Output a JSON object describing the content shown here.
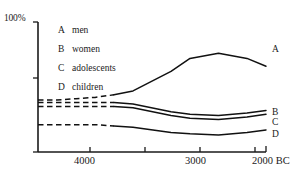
{
  "chart_data": {
    "type": "line",
    "title": "",
    "xlabel": "",
    "ylabel": "",
    "y_axis_top_label": "100%",
    "x_tick_labels": [
      "4000",
      "3000",
      "2000 BC"
    ],
    "x_tick_values": [
      4000,
      3000,
      2000
    ],
    "xlim": [
      4400,
      2000
    ],
    "ylim": [
      0,
      100
    ],
    "grid": false,
    "legend_position": "inside-upper-left",
    "x_axis_direction": "decreasing",
    "note": "Values are percentages of population; left portion of each curve is dashed (estimated/extrapolated), right portion solid (attested).",
    "series": [
      {
        "key": "A",
        "name": "men",
        "end_label": "A",
        "style": "dashed-then-solid",
        "dash_until_x": 3600,
        "x": [
          4400,
          4200,
          4000,
          3800,
          3600,
          3400,
          3000,
          2800,
          2500,
          2200,
          2000
        ],
        "values": [
          40,
          40,
          41,
          42,
          44,
          47,
          62,
          72,
          76,
          72,
          66
        ]
      },
      {
        "key": "B",
        "name": "women",
        "end_label": "B",
        "style": "dashed-then-solid",
        "dash_until_x": 3600,
        "x": [
          4400,
          4200,
          4000,
          3800,
          3600,
          3400,
          3000,
          2800,
          2500,
          2200,
          2000
        ],
        "values": [
          38,
          38,
          38,
          38,
          38,
          37,
          31,
          29,
          28,
          30,
          32
        ]
      },
      {
        "key": "C",
        "name": "adolescents",
        "end_label": "C",
        "style": "dashed-then-solid",
        "dash_until_x": 3600,
        "x": [
          4400,
          4200,
          4000,
          3800,
          3600,
          3400,
          3000,
          2800,
          2500,
          2200,
          2000
        ],
        "values": [
          35,
          35,
          35,
          35,
          35,
          34,
          28,
          26,
          25,
          27,
          29
        ]
      },
      {
        "key": "D",
        "name": "children",
        "end_label": "D",
        "style": "dashed-then-solid",
        "dash_until_x": 3600,
        "x": [
          4400,
          4200,
          4000,
          3800,
          3600,
          3400,
          3000,
          2800,
          2500,
          2200,
          2000
        ],
        "values": [
          21,
          21,
          21,
          21,
          20,
          19,
          15,
          14,
          13,
          15,
          17
        ]
      }
    ],
    "legend": [
      {
        "key": "A",
        "label": "men"
      },
      {
        "key": "B",
        "label": "women"
      },
      {
        "key": "C",
        "label": "adolescents"
      },
      {
        "key": "D",
        "label": "children"
      }
    ],
    "colors": {
      "line": "#111111",
      "axis": "#1a1a1a",
      "background": "#ffffff"
    }
  }
}
